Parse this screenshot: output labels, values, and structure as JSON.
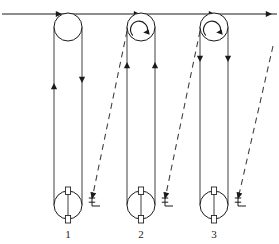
{
  "diagram": {
    "type": "technical-line-drawing",
    "background_color": "#ffffff",
    "line_color": "#1a1a1a",
    "dashed_line_color": "#3a3a3a",
    "canvas": {
      "width": 279,
      "height": 244
    },
    "overhead_cable": {
      "name": "overhead-cable",
      "y": 14,
      "x_start": 2,
      "x_end": 277,
      "direction": "rightward",
      "arrow_marker_positions": [
        62,
        140,
        215,
        272
      ],
      "arrow_direction": "right"
    },
    "assemblies": [
      {
        "label": "1",
        "label_x": 68,
        "label_y": 238,
        "center_x": 68,
        "top_pulley": {
          "name": "top-pulley-1",
          "cx": 68,
          "cy": 27,
          "r": 14,
          "has_rotation_arrow": false,
          "rotation": "none"
        },
        "bottom_pulley": {
          "name": "bottom-pulley-1",
          "cx": 68,
          "cy": 205,
          "r": 14,
          "axle_top_y": 187,
          "axle_bottom_y": 223
        },
        "left_cable": {
          "x": 54,
          "y_top": 27,
          "y_bottom": 205,
          "arrow_y": 83,
          "arrow_direction": "up"
        },
        "right_cable": {
          "x": 82,
          "y_top": 27,
          "y_bottom": 205,
          "arrow_y": 83,
          "arrow_direction": "down"
        },
        "hook": {
          "name": "anchor-hook-1",
          "x": 92,
          "y": 201
        },
        "dashed_line": null
      },
      {
        "label": "2",
        "label_x": 141,
        "label_y": 238,
        "center_x": 141,
        "top_pulley": {
          "name": "top-pulley-2",
          "cx": 141,
          "cy": 27,
          "r": 14,
          "has_rotation_arrow": true,
          "rotation": "clockwise"
        },
        "bottom_pulley": {
          "name": "bottom-pulley-2",
          "cx": 141,
          "cy": 205,
          "r": 14,
          "axle_top_y": 187,
          "axle_bottom_y": 223
        },
        "left_cable": {
          "x": 127,
          "y_top": 27,
          "y_bottom": 205,
          "arrow_y": 62,
          "arrow_direction": "up"
        },
        "right_cable": {
          "x": 155,
          "y_top": 27,
          "y_bottom": 205,
          "arrow_y": 62,
          "arrow_direction": "up"
        },
        "hook": {
          "name": "anchor-hook-2",
          "x": 165,
          "y": 201
        },
        "dashed_line": {
          "name": "dashed-reference-line-1",
          "x1": 127,
          "y1": 31,
          "x2": 92,
          "y2": 199
        }
      },
      {
        "label": "3",
        "label_x": 214,
        "label_y": 238,
        "center_x": 214,
        "top_pulley": {
          "name": "top-pulley-3",
          "cx": 214,
          "cy": 27,
          "r": 14,
          "has_rotation_arrow": true,
          "rotation": "clockwise"
        },
        "bottom_pulley": {
          "name": "bottom-pulley-3",
          "cx": 214,
          "cy": 205,
          "r": 14,
          "axle_top_y": 187,
          "axle_bottom_y": 223
        },
        "left_cable": {
          "x": 200,
          "y_top": 27,
          "y_bottom": 205,
          "arrow_y": 62,
          "arrow_direction": "down"
        },
        "right_cable": {
          "x": 228,
          "y_top": 27,
          "y_bottom": 205,
          "arrow_y": 62,
          "arrow_direction": "down"
        },
        "hook": {
          "name": "anchor-hook-3",
          "x": 238,
          "y": 201
        },
        "dashed_line": {
          "name": "dashed-reference-line-2",
          "x1": 200,
          "y1": 31,
          "x2": 165,
          "y2": 199
        }
      }
    ],
    "trailing_dashed_line": {
      "name": "dashed-reference-line-3",
      "x1": 273,
      "y1": 46,
      "x2": 238,
      "y2": 199
    },
    "labels": [
      "1",
      "2",
      "3"
    ]
  }
}
